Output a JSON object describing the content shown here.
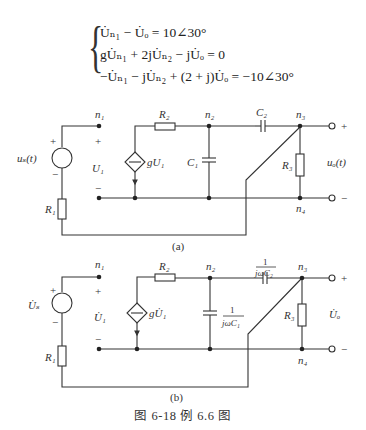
{
  "equations": {
    "line1": "U̇ₙ₁ − U̇ₒ = 10∠30°",
    "line2": "gU̇ₙ₁ + 2jU̇ₙ₂ − jU̇ₒ = 0",
    "line3": "−U̇ₙ₁ − jU̇ₙ₂ + (2 + j)U̇ₒ = −10∠30°"
  },
  "circuit_a": {
    "label": "(a)",
    "source": "uₛ(t)",
    "n1": "n₁",
    "n2": "n₂",
    "n3": "n₃",
    "n4": "n₄",
    "R1": "R₁",
    "R2": "R₂",
    "R3": "R₃",
    "C1": "C₁",
    "C2": "C₂",
    "U1": "U₁",
    "dep_source": "gU₁",
    "output": "uₒ(t)",
    "plus": "+",
    "minus": "−"
  },
  "circuit_b": {
    "label": "(b)",
    "source": "U̇ₛ",
    "n1": "n₁",
    "n2": "n₂",
    "n3": "n₃",
    "n4": "n₄",
    "R1": "R₁",
    "R2": "R₂",
    "R3": "R₃",
    "C1_num": "1",
    "C1_den": "jωC₁",
    "C2_num": "1",
    "C2_den": "jωC₂",
    "U1": "U̇₁",
    "dep_source": "gU̇₁",
    "output": "U̇ₒ",
    "plus": "+",
    "minus": "−"
  },
  "caption": "图 6-18   例 6.6 图"
}
